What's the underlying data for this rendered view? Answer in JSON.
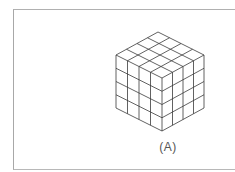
{
  "figure": {
    "label": "(A)",
    "grid_size": 4,
    "line_color": "#3a3a3a",
    "frame_color": "#a8a8a8"
  }
}
